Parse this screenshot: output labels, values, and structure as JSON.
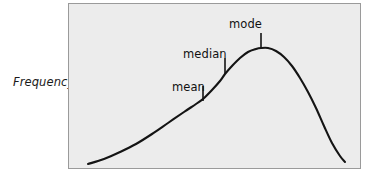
{
  "figure": {
    "name": "skewed-frequency-distribution",
    "background_color": "#ffffff",
    "plot_fill_color": "#ececec",
    "plot_border_color": "#9a9a9a",
    "curve_color": "#141414"
  },
  "axes": {
    "y_axis_title": "Frequency",
    "x_axis_title": ""
  },
  "annotations": [
    {
      "id": "mean",
      "label": "mean",
      "label_x": 172,
      "label_y": 80,
      "tick_x": 203,
      "tick_top": 86,
      "tick_bottom": 101
    },
    {
      "id": "median",
      "label": "median",
      "label_x": 183,
      "label_y": 47,
      "tick_x": 225,
      "tick_top": 58,
      "tick_bottom": 74
    },
    {
      "id": "mode",
      "label": "mode",
      "label_x": 229,
      "label_y": 17,
      "tick_x": 261,
      "tick_top": 33,
      "tick_bottom": 48
    }
  ],
  "chart_data": {
    "type": "line",
    "title": "",
    "subtitle": "",
    "xlabel": "",
    "ylabel": "Frequency",
    "grid": false,
    "legend": null,
    "plot_box": {
      "x0": 68,
      "y0": 3,
      "x1": 360,
      "y1": 168
    },
    "series": [
      {
        "name": "frequency-curve",
        "color": "#141414",
        "points": [
          [
            88,
            164
          ],
          [
            104,
            159
          ],
          [
            120,
            152
          ],
          [
            136,
            144
          ],
          [
            152,
            134
          ],
          [
            168,
            123
          ],
          [
            184,
            112
          ],
          [
            196,
            104
          ],
          [
            203,
            99
          ],
          [
            212,
            90
          ],
          [
            220,
            81
          ],
          [
            225,
            74
          ],
          [
            232,
            66
          ],
          [
            240,
            58
          ],
          [
            248,
            52
          ],
          [
            256,
            49
          ],
          [
            261,
            48
          ],
          [
            268,
            48
          ],
          [
            276,
            51
          ],
          [
            284,
            57
          ],
          [
            292,
            66
          ],
          [
            300,
            78
          ],
          [
            308,
            92
          ],
          [
            316,
            108
          ],
          [
            324,
            126
          ],
          [
            332,
            143
          ],
          [
            340,
            156
          ],
          [
            345,
            162
          ]
        ]
      }
    ],
    "markers": [
      {
        "label": "mean",
        "x": 203,
        "y_curve": 101
      },
      {
        "label": "median",
        "x": 225,
        "y_curve": 74
      },
      {
        "label": "mode",
        "x": 261,
        "y_curve": 48
      }
    ],
    "axis_ranges": {
      "x": [
        68,
        360
      ],
      "y": [
        3,
        168
      ]
    },
    "ordering_note": "mean < median < mode"
  }
}
